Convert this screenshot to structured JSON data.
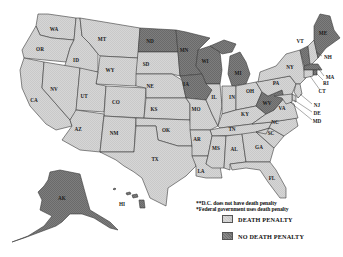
{
  "map": {
    "title": "",
    "region": "United States",
    "categories": {
      "death_penalty": {
        "label": "DEATH PENALTY",
        "color": "#d0d0d0"
      },
      "no_death_penalty": {
        "label": "NO DEATH PENALTY",
        "color": "#7a7a7a"
      }
    },
    "states": {
      "WA": {
        "label": "WA",
        "status": "death_penalty"
      },
      "OR": {
        "label": "OR",
        "status": "death_penalty"
      },
      "CA": {
        "label": "CA",
        "status": "death_penalty"
      },
      "ID": {
        "label": "ID",
        "status": "death_penalty"
      },
      "NV": {
        "label": "NV",
        "status": "death_penalty"
      },
      "MT": {
        "label": "MT",
        "status": "death_penalty"
      },
      "WY": {
        "label": "WY",
        "status": "death_penalty"
      },
      "UT": {
        "label": "UT",
        "status": "death_penalty"
      },
      "CO": {
        "label": "CO",
        "status": "death_penalty"
      },
      "AZ": {
        "label": "AZ",
        "status": "death_penalty"
      },
      "NM": {
        "label": "NM",
        "status": "death_penalty"
      },
      "ND": {
        "label": "ND",
        "status": "no_death_penalty"
      },
      "SD": {
        "label": "SD",
        "status": "death_penalty"
      },
      "NE": {
        "label": "NE",
        "status": "death_penalty"
      },
      "KS": {
        "label": "KS",
        "status": "death_penalty"
      },
      "OK": {
        "label": "OK",
        "status": "death_penalty"
      },
      "TX": {
        "label": "TX",
        "status": "death_penalty"
      },
      "MN": {
        "label": "MN",
        "status": "no_death_penalty"
      },
      "IA": {
        "label": "IA",
        "status": "no_death_penalty"
      },
      "MO": {
        "label": "MO",
        "status": "death_penalty"
      },
      "AR": {
        "label": "AR",
        "status": "death_penalty"
      },
      "LA": {
        "label": "LA",
        "status": "death_penalty"
      },
      "WI": {
        "label": "WI",
        "status": "no_death_penalty"
      },
      "IL": {
        "label": "IL",
        "status": "death_penalty"
      },
      "MI": {
        "label": "MI",
        "status": "no_death_penalty"
      },
      "IN": {
        "label": "IN",
        "status": "death_penalty"
      },
      "OH": {
        "label": "OH",
        "status": "death_penalty"
      },
      "KY": {
        "label": "KY",
        "status": "death_penalty"
      },
      "TN": {
        "label": "TN",
        "status": "death_penalty"
      },
      "MS": {
        "label": "MS",
        "status": "death_penalty"
      },
      "AL": {
        "label": "AL",
        "status": "death_penalty"
      },
      "GA": {
        "label": "GA",
        "status": "death_penalty"
      },
      "FL": {
        "label": "FL",
        "status": "death_penalty"
      },
      "SC": {
        "label": "SC",
        "status": "death_penalty"
      },
      "NC": {
        "label": "NC",
        "status": "death_penalty"
      },
      "VA": {
        "label": "VA",
        "status": "death_penalty"
      },
      "WV": {
        "label": "WV",
        "status": "no_death_penalty"
      },
      "PA": {
        "label": "PA",
        "status": "death_penalty"
      },
      "NY": {
        "label": "NY",
        "status": "death_penalty"
      },
      "VT": {
        "label": "VT",
        "status": "no_death_penalty"
      },
      "NH": {
        "label": "NH",
        "status": "death_penalty"
      },
      "ME": {
        "label": "ME",
        "status": "no_death_penalty"
      },
      "MA": {
        "label": "MA",
        "status": "no_death_penalty"
      },
      "RI": {
        "label": "RI",
        "status": "no_death_penalty"
      },
      "CT": {
        "label": "CT",
        "status": "death_penalty"
      },
      "NJ": {
        "label": "NJ",
        "status": "death_penalty"
      },
      "DE": {
        "label": "DE",
        "status": "death_penalty"
      },
      "MD": {
        "label": "MD",
        "status": "death_penalty"
      },
      "AK": {
        "label": "AK",
        "status": "no_death_penalty"
      },
      "HI": {
        "label": "HI",
        "status": "no_death_penalty"
      }
    }
  },
  "notes": {
    "dc": "**D.C. does not have death penalty",
    "federal": "*Federal government uses death penalty"
  },
  "legend": {
    "items": [
      {
        "label": "DEATH PENALTY",
        "swatch": "light"
      },
      {
        "label": "NO DEATH PENALTY",
        "swatch": "dark"
      }
    ]
  }
}
